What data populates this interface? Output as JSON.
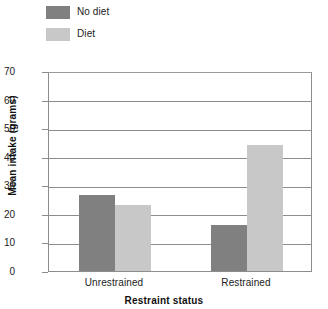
{
  "chart_data": {
    "type": "bar",
    "title": "",
    "xlabel": "Restraint status",
    "ylabel": "Mean intake (grams)",
    "categories": [
      "Unrestrained",
      "Restrained"
    ],
    "series": [
      {
        "name": "No diet",
        "values": [
          26.5,
          16
        ],
        "color": "#808080"
      },
      {
        "name": "Diet",
        "values": [
          23,
          44
        ],
        "color": "#c8c8c8"
      }
    ],
    "ylim": [
      0,
      70
    ],
    "ytick_step": 10,
    "yticks": [
      "0",
      "10",
      "20",
      "30",
      "40",
      "50",
      "60",
      "70"
    ],
    "grid": true,
    "legend_position": "top-left"
  },
  "legend": {
    "items": [
      {
        "label": "No diet"
      },
      {
        "label": "Diet"
      }
    ]
  },
  "axes": {
    "x_title": "Restraint status",
    "y_title": "Mean intake (grams)"
  }
}
